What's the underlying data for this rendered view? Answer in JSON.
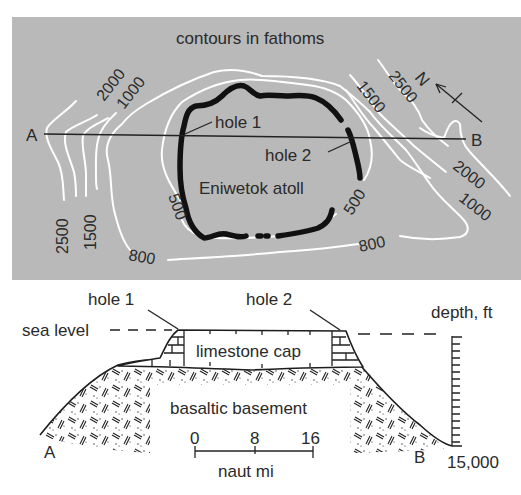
{
  "map": {
    "title": "contours in fathoms",
    "background_color": "#b8b8b8",
    "contour_color": "#ffffff",
    "reef_color": "#111111",
    "section_line": {
      "start_label": "A",
      "end_label": "B"
    },
    "hole_labels": [
      "hole 1",
      "hole 2"
    ],
    "atoll_label": "Eniwetok atoll",
    "north_arrow_label": "N",
    "contour_labels": {
      "west": [
        "2000",
        "1000",
        "2500",
        "1500"
      ],
      "northeast": [
        "1500",
        "2500"
      ],
      "east": [
        "2000",
        "1000"
      ],
      "inner": [
        "500",
        "500"
      ],
      "outer": [
        "800",
        "800"
      ]
    }
  },
  "section": {
    "hole_labels": [
      "hole 1",
      "hole 2"
    ],
    "sea_level_label": "sea level",
    "depth_axis_label": "depth, ft",
    "depth_max_label": "15,000",
    "layers": [
      "limestone cap",
      "basaltic basement"
    ],
    "end_labels": {
      "left": "A",
      "right": "B"
    },
    "scale_bar": {
      "ticks": [
        "0",
        "8",
        "16"
      ],
      "unit": "naut mi"
    }
  }
}
